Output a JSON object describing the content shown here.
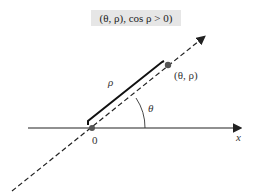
{
  "caption": "(θ, ρ), cos ρ > 0)",
  "labels": {
    "rho": "ρ",
    "point": "(θ, ρ)",
    "theta": "θ",
    "origin": "0",
    "x_axis": "x"
  },
  "colors": {
    "line": "#222222",
    "point": "#555555",
    "caption_bg": "#e6e6e6"
  }
}
